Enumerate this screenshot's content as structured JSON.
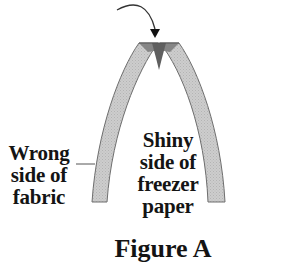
{
  "figure": {
    "caption": "Figure A",
    "labels": {
      "wrong_side": [
        "Wrong",
        "side of",
        "fabric"
      ],
      "shiny_side": [
        "Shiny",
        "side of",
        "freezer",
        "paper"
      ]
    },
    "colors": {
      "strip_fill": "#c8c8c8",
      "strip_outline": "#6e6e6e",
      "fold_fill": "#7a7a7a",
      "fold_dark": "#5a5a5a",
      "text": "#141414"
    }
  }
}
